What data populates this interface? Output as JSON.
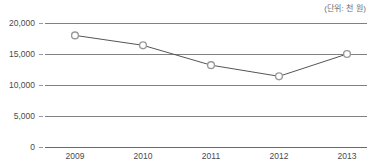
{
  "unit_note": "(단위: 천 원)",
  "chart_data": {
    "type": "line",
    "title": "",
    "subtitle": "",
    "xlabel": "",
    "ylabel": "",
    "unit_label": "(단위: 천 원)",
    "categories": [
      "2009",
      "2010",
      "2011",
      "2012",
      "2013"
    ],
    "values": [
      18000,
      16400,
      13200,
      11400,
      15000
    ],
    "series": [
      {
        "name": "",
        "values": [
          18000,
          16400,
          13200,
          11400,
          15000
        ]
      }
    ],
    "ylim": [
      0,
      20000
    ],
    "ytick_labels": [
      "20,000",
      "15,000",
      "10,000",
      "5,000",
      "0"
    ],
    "ytick_values": [
      20000,
      15000,
      10000,
      5000,
      0
    ],
    "grid": true,
    "legend": "none",
    "line_color": "#555555",
    "marker_fill": "#ffffff",
    "marker_stroke": "#9a9a9a",
    "gridline_color": "#808080",
    "text_color": "#4a4a4a"
  }
}
